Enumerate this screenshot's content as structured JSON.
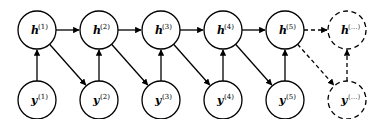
{
  "diagram": {
    "type": "graphical-model",
    "colors": {
      "stroke": "#000000",
      "fill": "#ffffff"
    },
    "hidden_nodes": [
      {
        "id": "h1",
        "base": "h",
        "sup": "(1)",
        "cx": 37,
        "cy": 30,
        "dashed": false
      },
      {
        "id": "h2",
        "base": "h",
        "sup": "(2)",
        "cx": 99,
        "cy": 30,
        "dashed": false
      },
      {
        "id": "h3",
        "base": "h",
        "sup": "(3)",
        "cx": 161,
        "cy": 30,
        "dashed": false
      },
      {
        "id": "h4",
        "base": "h",
        "sup": "(4)",
        "cx": 223,
        "cy": 30,
        "dashed": false
      },
      {
        "id": "h5",
        "base": "h",
        "sup": "(5)",
        "cx": 285,
        "cy": 30,
        "dashed": false
      },
      {
        "id": "hn",
        "base": "h",
        "sup": "(...)",
        "cx": 347,
        "cy": 30,
        "dashed": true
      }
    ],
    "observed_nodes": [
      {
        "id": "y1",
        "base": "y",
        "sup": "(1)",
        "cx": 37,
        "cy": 100,
        "dashed": false
      },
      {
        "id": "y2",
        "base": "y",
        "sup": "(2)",
        "cx": 99,
        "cy": 100,
        "dashed": false
      },
      {
        "id": "y3",
        "base": "y",
        "sup": "(3)",
        "cx": 161,
        "cy": 100,
        "dashed": false
      },
      {
        "id": "y4",
        "base": "y",
        "sup": "(4)",
        "cx": 223,
        "cy": 100,
        "dashed": false
      },
      {
        "id": "y5",
        "base": "y",
        "sup": "(5)",
        "cx": 285,
        "cy": 100,
        "dashed": false
      },
      {
        "id": "yn",
        "base": "y",
        "sup": "(...)",
        "cx": 347,
        "cy": 100,
        "dashed": true
      }
    ],
    "edges": [
      {
        "from": "h1",
        "to": "h2",
        "dashed": false
      },
      {
        "from": "h2",
        "to": "h3",
        "dashed": false
      },
      {
        "from": "h3",
        "to": "h4",
        "dashed": false
      },
      {
        "from": "h4",
        "to": "h5",
        "dashed": false
      },
      {
        "from": "h5",
        "to": "hn",
        "dashed": true
      },
      {
        "from": "y1",
        "to": "h1",
        "dashed": false
      },
      {
        "from": "y2",
        "to": "h2",
        "dashed": false
      },
      {
        "from": "y3",
        "to": "h3",
        "dashed": false
      },
      {
        "from": "y4",
        "to": "h4",
        "dashed": false
      },
      {
        "from": "y5",
        "to": "h5",
        "dashed": false
      },
      {
        "from": "yn",
        "to": "hn",
        "dashed": true
      },
      {
        "from": "h1",
        "to": "y2",
        "dashed": false
      },
      {
        "from": "h2",
        "to": "y3",
        "dashed": false
      },
      {
        "from": "h3",
        "to": "y4",
        "dashed": false
      },
      {
        "from": "h4",
        "to": "y5",
        "dashed": false
      },
      {
        "from": "h5",
        "to": "yn",
        "dashed": true
      }
    ],
    "node_radius": 19
  }
}
